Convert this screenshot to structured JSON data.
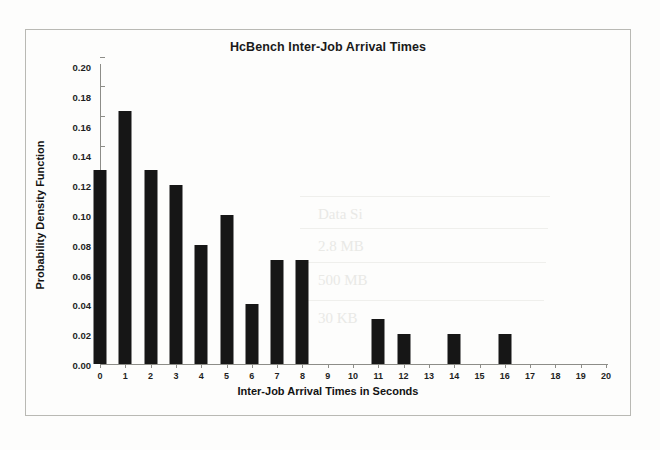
{
  "chart_data": {
    "type": "bar",
    "title": "HcBench Inter-Job  Arrival Times",
    "xlabel": "Inter-Job Arrival Times in Seconds",
    "ylabel": "Probability Density Function",
    "categories": [
      "0",
      "1",
      "2",
      "3",
      "4",
      "5",
      "6",
      "7",
      "8",
      "9",
      "10",
      "11",
      "12",
      "13",
      "14",
      "15",
      "16",
      "17",
      "18",
      "19",
      "20"
    ],
    "values": [
      0.13,
      0.17,
      0.13,
      0.12,
      0.08,
      0.1,
      0.04,
      0.07,
      0.07,
      0.0,
      0.0,
      0.03,
      0.02,
      0.0,
      0.02,
      0.0,
      0.02,
      0.0,
      0.0,
      0.0,
      0.0
    ],
    "ylim": [
      0.0,
      0.2
    ],
    "ytick_labels": [
      "0.00",
      "0.02",
      "0.04",
      "0.06",
      "0.08",
      "0.10",
      "0.12",
      "0.14",
      "0.16",
      "0.18",
      "0.20"
    ],
    "ytick_values": [
      0.0,
      0.02,
      0.04,
      0.06,
      0.08,
      0.1,
      0.12,
      0.14,
      0.16,
      0.18,
      0.2
    ],
    "xlim": [
      0,
      20
    ],
    "grid": false,
    "legend": false,
    "bar_color": "#161616",
    "axis_color": "#8d8d88"
  },
  "figure": {
    "border_color": "#b9b9b4",
    "background": "#fdfdfc"
  },
  "ghost_text": {
    "lines": [
      "Data Si",
      "2.8 MB",
      "500 MB",
      "30 KB"
    ]
  }
}
